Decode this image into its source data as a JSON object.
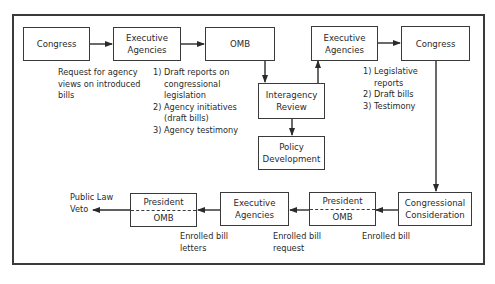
{
  "diagram": {
    "boxes": {
      "congress_top": "Congress",
      "exec_agencies_top": [
        "Executive",
        "Agencies"
      ],
      "omb_top": "OMB",
      "interagency_review": [
        "Interagency",
        "Review"
      ],
      "policy_development": [
        "Policy",
        "Development"
      ],
      "exec_agencies_top_right": [
        "Executive",
        "Agencies"
      ],
      "congress_top_right": "Congress",
      "congressional_consideration": [
        "Congressional",
        "Consideration"
      ],
      "president_omb_right": {
        "top": "President",
        "bottom": "OMB"
      },
      "exec_agencies_bottom": [
        "Executive",
        "Agencies"
      ],
      "president_omb_left": {
        "top": "President",
        "bottom": "OMB"
      }
    },
    "notes": {
      "request_for_views": [
        "Request for agency",
        "views on introduced",
        "bills"
      ],
      "exec_outputs": [
        {
          "num": "1)",
          "lines": [
            "Draft reports on",
            "congressional",
            "legislation"
          ]
        },
        {
          "num": "2)",
          "lines": [
            "Agency initiatives",
            "(draft bills)"
          ]
        },
        {
          "num": "3)",
          "lines": [
            "Agency testimony"
          ]
        }
      ],
      "exec_right_outputs": [
        {
          "num": "1)",
          "lines": [
            "Legislative",
            "reports"
          ]
        },
        {
          "num": "2)",
          "lines": [
            "Draft bills"
          ]
        },
        {
          "num": "3)",
          "lines": [
            "Testimony"
          ]
        }
      ],
      "enrolled_bill": "Enrolled bill",
      "enrolled_bill_request": [
        "Enrolled bill",
        "request"
      ],
      "enrolled_bill_letters": [
        "Enrolled bill",
        "letters"
      ],
      "outcome": [
        "Public Law",
        "Veto"
      ]
    },
    "edges": [
      {
        "from": "congress_top",
        "to": "exec_agencies_top"
      },
      {
        "from": "exec_agencies_top",
        "to": "omb_top"
      },
      {
        "from": "omb_top",
        "to": "interagency_review"
      },
      {
        "from": "interagency_review",
        "to": "policy_development"
      },
      {
        "from": "interagency_review",
        "to": "exec_agencies_top_right"
      },
      {
        "from": "exec_agencies_top_right",
        "to": "congress_top_right"
      },
      {
        "from": "congress_top_right",
        "to": "congressional_consideration"
      },
      {
        "from": "congressional_consideration",
        "to": "president_omb_right"
      },
      {
        "from": "president_omb_right",
        "to": "exec_agencies_bottom"
      },
      {
        "from": "exec_agencies_bottom",
        "to": "president_omb_left"
      },
      {
        "from": "president_omb_left",
        "to": "outcome"
      }
    ]
  }
}
